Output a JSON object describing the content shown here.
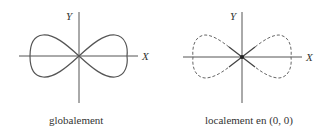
{
  "figures": [
    {
      "name": "global",
      "x_label": "X",
      "y_label": "Y",
      "caption": "globalement",
      "curve_style": "solid"
    },
    {
      "name": "local",
      "x_label": "X",
      "y_label": "Y",
      "caption": "localement en (0, 0)",
      "curve_style": "dashed outside neighborhood, solid near origin"
    }
  ],
  "colors": {
    "stroke": "#555555",
    "text": "#333333"
  }
}
